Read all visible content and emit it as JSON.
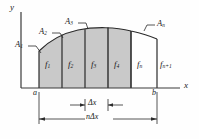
{
  "figure": {
    "type": "integration-strips-diagram",
    "axes": {
      "y_label": "y",
      "x_label": "x"
    },
    "endpoints": {
      "left": "a",
      "right": "b"
    },
    "area_labels": [
      {
        "name": "A",
        "sub": "1"
      },
      {
        "name": "A",
        "sub": "2"
      },
      {
        "name": "A",
        "sub": "3"
      },
      {
        "name": "A",
        "sub": "n"
      }
    ],
    "ordinate_labels": [
      {
        "name": "f",
        "sub": "1"
      },
      {
        "name": "f",
        "sub": "2"
      },
      {
        "name": "f",
        "sub": "3"
      },
      {
        "name": "f",
        "sub": "4"
      },
      {
        "name": "f",
        "sub": "n"
      },
      {
        "name": "f",
        "sub": "n+1"
      }
    ],
    "dimensions": [
      {
        "id": "strip-width",
        "symbol": "Δ",
        "var": "x",
        "text": "Δx"
      },
      {
        "id": "total-width",
        "prefix": "n",
        "symbol": "Δ",
        "var": "x",
        "text": "nΔx"
      }
    ],
    "caption": "",
    "colors": {
      "fill": "#c9c9c9",
      "stroke": "#2b2b2b",
      "axis": "#3a3a3a",
      "dimension": "#2b2b2b"
    }
  }
}
